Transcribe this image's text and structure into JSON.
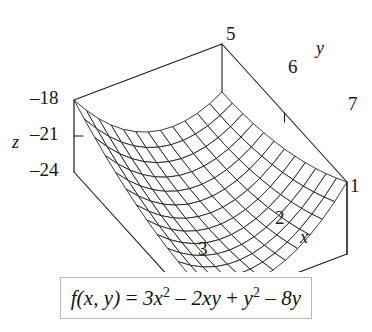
{
  "figure": {
    "kind": "3d-surface-plot",
    "background": "#ffffff",
    "line_color": "#1a1a1a"
  },
  "axes": {
    "x": {
      "label": "x",
      "ticks": [
        "1",
        "2",
        "3"
      ],
      "range": [
        1,
        3
      ]
    },
    "y": {
      "label": "y",
      "ticks": [
        "5",
        "6",
        "7"
      ],
      "range": [
        5,
        7
      ]
    },
    "z": {
      "label": "z",
      "ticks": [
        "-18",
        "-21",
        "-24"
      ],
      "ticks_display": [
        "–18",
        "–21",
        "–24"
      ],
      "range": [
        -24,
        -18
      ]
    }
  },
  "formula": {
    "lhs": "f(x, y)",
    "equals": "=",
    "term1": "3x",
    "term1_exp": "2",
    "op1": "–",
    "term2": "2xy",
    "op2": "+",
    "term3": "y",
    "term3_exp": "2",
    "op3": "–",
    "term4": "8y",
    "plain": "f(x, y) = 3x² – 2xy + y² – 8y",
    "border_color": "#b6b6b6"
  },
  "chart_data": {
    "type": "surface",
    "title": "",
    "function": "f(x, y) = 3x^2 - 2xy + y^2 - 8y",
    "xlabel": "x",
    "ylabel": "y",
    "zlabel": "z",
    "xlim": [
      1,
      3
    ],
    "ylim": [
      5,
      7
    ],
    "zlim": [
      -24,
      -18
    ],
    "xticks": [
      1,
      2,
      3
    ],
    "yticks": [
      5,
      6,
      7
    ],
    "zticks": [
      -24,
      -21,
      -18
    ],
    "grid": false,
    "legend": "none",
    "mesh_steps_x": 12,
    "mesh_steps_y": 12,
    "surface_color": "#ffffff",
    "wireframe_color": "#1a1a1a"
  },
  "labels": {
    "z_axis_name": "z",
    "x_axis_name": "x",
    "y_axis_name": "y",
    "y_tick_5": "5",
    "y_tick_6": "6",
    "y_tick_7": "7",
    "x_tick_1": "1",
    "x_tick_2": "2",
    "x_tick_3": "3",
    "z_tick_top": "–18",
    "z_tick_mid": "–21",
    "z_tick_bot": "–24"
  }
}
